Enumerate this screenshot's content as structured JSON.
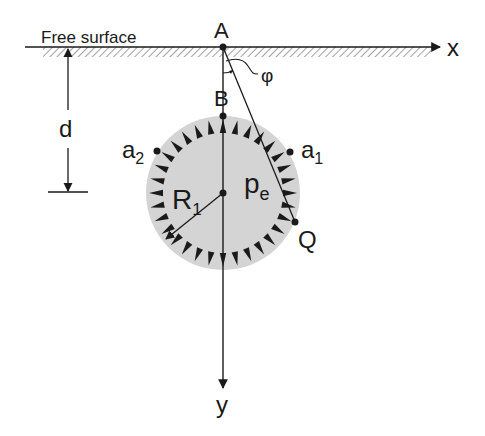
{
  "labels": {
    "free_surface": "Free surface",
    "point_a": "A",
    "point_b": "B",
    "x_axis": "x",
    "y_axis": "y",
    "angle": "φ",
    "depth": "d",
    "a2_base": "a",
    "a2_sub": "2",
    "a1_base": "a",
    "a1_sub": "1",
    "radius_base": "R",
    "radius_sub": "1",
    "pressure_base": "p",
    "pressure_sub": "e",
    "point_q": "Q"
  },
  "colors": {
    "line": "#1a1a1a",
    "circle_fill": "#d4d4d4",
    "hatch": "#8a8a8a"
  }
}
